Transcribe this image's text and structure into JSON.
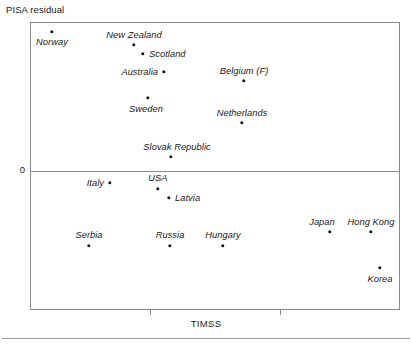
{
  "chart_data": {
    "type": "scatter",
    "title": "",
    "xlabel": "TIMSS",
    "ylabel": "PISA residual",
    "zero_label": "0",
    "grid": false,
    "legend": "none",
    "axis_notes": {
      "y_reference_line_value": 0,
      "x_tick_count": 2,
      "x_tick_labels": [
        "",
        ""
      ],
      "y_tick_labels": [
        "0"
      ]
    },
    "points": [
      {
        "label": "Norway",
        "px": 52,
        "py": 32,
        "lx": 52,
        "ly": 42,
        "anchor": "mid"
      },
      {
        "label": "New Zealand",
        "px": 134,
        "py": 45,
        "lx": 134,
        "ly": 35,
        "anchor": "mid"
      },
      {
        "label": "Scotland",
        "px": 143,
        "py": 54,
        "lx": 149,
        "ly": 54,
        "anchor": "start"
      },
      {
        "label": "Australia",
        "px": 164,
        "py": 72,
        "lx": 158,
        "ly": 72,
        "anchor": "end"
      },
      {
        "label": "Belgium (F)",
        "px": 244,
        "py": 81,
        "lx": 244,
        "ly": 71,
        "anchor": "mid"
      },
      {
        "label": "Sweden",
        "px": 148,
        "py": 98,
        "lx": 146,
        "ly": 109,
        "anchor": "mid"
      },
      {
        "label": "Netherlands",
        "px": 242,
        "py": 123,
        "lx": 242,
        "ly": 113,
        "anchor": "mid"
      },
      {
        "label": "Slovak Republic",
        "px": 171,
        "py": 157,
        "lx": 177,
        "ly": 147,
        "anchor": "mid"
      },
      {
        "label": "Italy",
        "px": 110,
        "py": 183,
        "lx": 104,
        "ly": 183,
        "anchor": "end"
      },
      {
        "label": "USA",
        "px": 158,
        "py": 189,
        "lx": 158,
        "ly": 178,
        "anchor": "mid"
      },
      {
        "label": "Latvia",
        "px": 169,
        "py": 198,
        "lx": 175,
        "ly": 198,
        "anchor": "start"
      },
      {
        "label": "Serbia",
        "px": 89,
        "py": 246,
        "lx": 89,
        "ly": 235,
        "anchor": "mid"
      },
      {
        "label": "Russia",
        "px": 170,
        "py": 246,
        "lx": 170,
        "ly": 235,
        "anchor": "mid"
      },
      {
        "label": "Hungary",
        "px": 223,
        "py": 246,
        "lx": 223,
        "ly": 235,
        "anchor": "mid"
      },
      {
        "label": "Japan",
        "px": 330,
        "py": 232,
        "lx": 322,
        "ly": 222,
        "anchor": "mid"
      },
      {
        "label": "Hong Kong",
        "px": 371,
        "py": 232,
        "lx": 371,
        "ly": 222,
        "anchor": "mid"
      },
      {
        "label": "Korea",
        "px": 380,
        "py": 268,
        "lx": 380,
        "ly": 279,
        "anchor": "mid"
      }
    ],
    "x_ticks_px": [
      150,
      280
    ]
  },
  "colors": {
    "point": "#111111",
    "axis": "#8a8a8a",
    "text": "#1a1a1a",
    "background": "#ffffff"
  }
}
